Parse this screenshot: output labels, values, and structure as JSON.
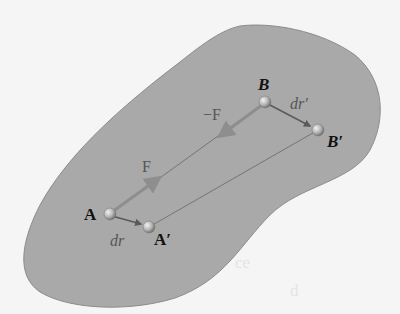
{
  "figure": {
    "colors": {
      "background": "#f5f5f5",
      "body_fill": "#a9a9a9",
      "body_stroke": "#8c8c8c",
      "force_arrow": "#8e8e8e",
      "displacement_arrow": "#5a5a5a",
      "connector_line": "#6e6e6e",
      "label": "#111111",
      "vector_label": "#555555"
    },
    "points": {
      "A": {
        "label": "A",
        "x": 110,
        "y": 214
      },
      "A_prime": {
        "label": "A′",
        "x": 149,
        "y": 227
      },
      "B": {
        "label": "B",
        "x": 265,
        "y": 102
      },
      "B_prime": {
        "label": "B′",
        "x": 318,
        "y": 130
      }
    },
    "vectors": {
      "F": {
        "label": "F"
      },
      "neg_F": {
        "label": "−F"
      },
      "dr": {
        "label": "dr"
      },
      "dr_prime": {
        "label": "dr′"
      }
    }
  }
}
